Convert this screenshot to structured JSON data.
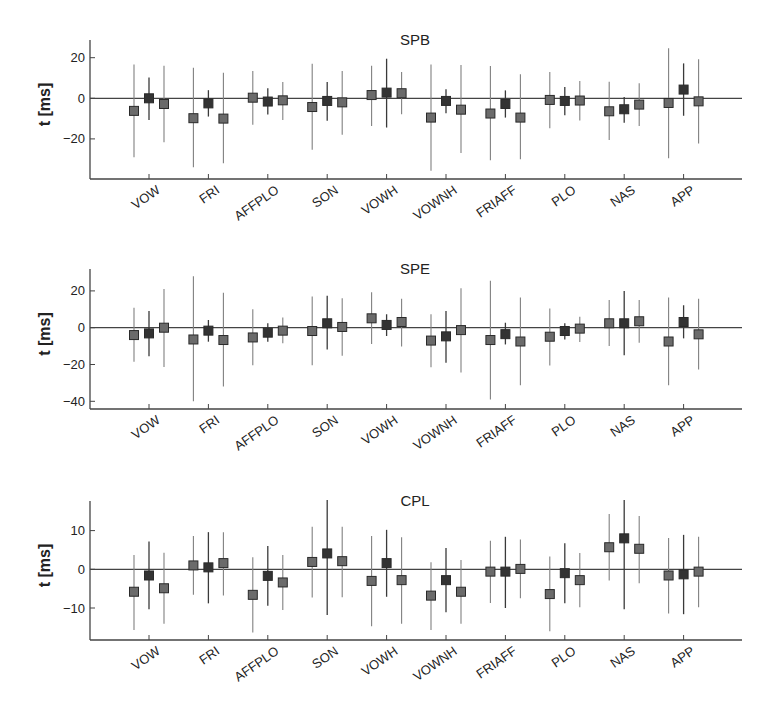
{
  "chart_data": [
    {
      "type": "scatter",
      "subtype": "errorbar",
      "title": "SPB",
      "xlabel": "",
      "ylabel": "t [ms]",
      "categories": [
        "VOW",
        "FRI",
        "AFFPLO",
        "SON",
        "VOWH",
        "VOWNH",
        "FRIAFF",
        "PLO",
        "NAS",
        "APP"
      ],
      "yticks": [
        20,
        0,
        -20
      ],
      "ytick_labels": [
        "20",
        "0",
        "−20"
      ],
      "ylim": [
        -40,
        29
      ],
      "zero_line": true,
      "grid": false,
      "series": [
        {
          "name": "left",
          "color": "#6b6b6b",
          "values": [
            -6.2,
            -9.8,
            0.3,
            -4.3,
            1.6,
            -9.5,
            -7.5,
            -0.8,
            -6.4,
            -2.3
          ],
          "upper": [
            16.7,
            15.0,
            13.4,
            17.0,
            16.0,
            16.7,
            15.9,
            13.0,
            8.2,
            24.6
          ],
          "lower": [
            -29.0,
            -34.0,
            -13.0,
            -25.4,
            -13.6,
            -35.7,
            -30.5,
            -14.8,
            -20.5,
            -29.5
          ]
        },
        {
          "name": "middle",
          "color": "#333333",
          "values": [
            0.0,
            -2.5,
            -1.6,
            -1.3,
            2.8,
            -1.3,
            -2.8,
            -1.3,
            -5.4,
            4.3
          ],
          "upper": [
            10.3,
            4.0,
            5.0,
            8.0,
            19.5,
            4.4,
            3.9,
            5.6,
            0.7,
            17.2
          ],
          "lower": [
            -10.7,
            -9.0,
            -8.0,
            -11.0,
            -14.4,
            -7.4,
            -9.5,
            -8.4,
            -12.0,
            -8.6
          ]
        },
        {
          "name": "right",
          "color": "#6b6b6b",
          "values": [
            -2.8,
            -10.0,
            -1.0,
            -2.0,
            2.5,
            -5.6,
            -9.5,
            -1.1,
            -3.1,
            -1.5
          ],
          "upper": [
            16.0,
            12.6,
            8.0,
            13.4,
            13.0,
            16.4,
            11.8,
            8.5,
            7.4,
            19.2
          ],
          "lower": [
            -21.6,
            -32.0,
            -10.7,
            -18.0,
            -7.9,
            -27.0,
            -30.0,
            -10.9,
            -13.6,
            -22.3
          ]
        }
      ],
      "layout": {
        "top": 40,
        "bottom": 179,
        "zero_y": 98.3,
        "px_per_unit": 2.03
      }
    },
    {
      "type": "scatter",
      "subtype": "errorbar",
      "title": "SPE",
      "xlabel": "",
      "ylabel": "t [ms]",
      "categories": [
        "VOW",
        "FRI",
        "AFFPLO",
        "SON",
        "VOWH",
        "VOWNH",
        "FRIAFF",
        "PLO",
        "NAS",
        "APP"
      ],
      "yticks": [
        20,
        0,
        -20,
        -40
      ],
      "ytick_labels": [
        "20",
        "0",
        "−20",
        "−40"
      ],
      "ylim": [
        -44,
        32
      ],
      "zero_line": true,
      "grid": false,
      "series": [
        {
          "name": "left",
          "color": "#6b6b6b",
          "values": [
            -4.0,
            -6.4,
            -5.3,
            -1.8,
            5.1,
            -7.0,
            -6.7,
            -4.9,
            2.4,
            -7.5
          ],
          "upper": [
            10.9,
            28.0,
            10.0,
            17.0,
            19.3,
            7.3,
            25.5,
            10.4,
            15.0,
            16.4
          ],
          "lower": [
            -18.5,
            -40.0,
            -20.4,
            -20.4,
            -8.9,
            -21.5,
            -39.0,
            -20.5,
            -10.0,
            -31.3
          ]
        },
        {
          "name": "middle",
          "color": "#333333",
          "values": [
            -3.1,
            -1.6,
            -2.7,
            2.4,
            1.5,
            -4.7,
            -3.5,
            -1.8,
            2.4,
            3.1
          ],
          "upper": [
            9.1,
            4.2,
            2.4,
            17.3,
            7.3,
            9.1,
            2.7,
            2.4,
            20.0,
            12.2
          ],
          "lower": [
            -15.5,
            -7.6,
            -7.6,
            -11.8,
            -4.5,
            -19.0,
            -9.1,
            -6.4,
            -15.0,
            -5.8
          ]
        },
        {
          "name": "right",
          "color": "#6b6b6b",
          "values": [
            0.0,
            -6.7,
            -1.6,
            0.4,
            3.1,
            -1.3,
            -7.5,
            -0.5,
            3.5,
            -3.6
          ],
          "upper": [
            21.0,
            19.0,
            5.6,
            16.0,
            15.8,
            21.5,
            16.4,
            6.0,
            15.0,
            15.8
          ],
          "lower": [
            -21.3,
            -32.0,
            -8.5,
            -15.3,
            -10.2,
            -24.4,
            -31.3,
            -7.8,
            -8.2,
            -22.7
          ]
        }
      ],
      "layout": {
        "top": 269,
        "bottom": 409,
        "zero_y": 327.7,
        "px_per_unit": 1.84
      }
    },
    {
      "type": "scatter",
      "subtype": "errorbar",
      "title": "CPL",
      "xlabel": "",
      "ylabel": "t [ms]",
      "categories": [
        "VOW",
        "FRI",
        "AFFPLO",
        "SON",
        "VOWH",
        "VOWNH",
        "FRIAFF",
        "PLO",
        "NAS",
        "APP"
      ],
      "yticks": [
        10,
        0,
        -10
      ],
      "ytick_labels": [
        "10",
        "0",
        "−10"
      ],
      "ylim": [
        -18,
        18
      ],
      "zero_line": true,
      "grid": false,
      "series": [
        {
          "name": "left",
          "color": "#6b6b6b",
          "values": [
            -5.8,
            1.0,
            -6.6,
            1.9,
            -3.0,
            -6.8,
            -0.6,
            -6.4,
            5.7,
            -1.6
          ],
          "upper": [
            3.7,
            8.6,
            3.1,
            11.0,
            8.6,
            1.8,
            7.4,
            3.3,
            14.3,
            8.1
          ],
          "lower": [
            -15.7,
            -6.6,
            -16.3,
            -7.3,
            -14.7,
            -15.7,
            -8.7,
            -16.0,
            -2.9,
            -11.4
          ]
        },
        {
          "name": "middle",
          "color": "#333333",
          "values": [
            -1.6,
            0.5,
            -1.7,
            4.1,
            1.6,
            -2.8,
            -0.6,
            -1.0,
            8.0,
            -1.3
          ],
          "upper": [
            7.2,
            9.6,
            6.0,
            17.9,
            10.2,
            5.5,
            8.4,
            6.7,
            17.9,
            8.9
          ],
          "lower": [
            -10.3,
            -8.8,
            -9.4,
            -11.8,
            -7.1,
            -11.1,
            -10.0,
            -8.8,
            -10.3,
            -11.6
          ]
        },
        {
          "name": "right",
          "color": "#6b6b6b",
          "values": [
            -4.9,
            1.6,
            -3.4,
            2.1,
            -2.8,
            -5.8,
            0.1,
            -2.8,
            5.3,
            -0.6
          ],
          "upper": [
            4.3,
            9.6,
            3.7,
            11.0,
            8.3,
            2.4,
            7.7,
            4.2,
            13.8,
            8.4
          ],
          "lower": [
            -14.1,
            -6.8,
            -10.5,
            -7.2,
            -14.1,
            -14.1,
            -7.5,
            -9.8,
            -3.6,
            -9.8
          ]
        }
      ],
      "layout": {
        "top": 501,
        "bottom": 640,
        "zero_y": 569.3,
        "px_per_unit": 3.87
      }
    }
  ],
  "panels": [
    {
      "title": "SPB",
      "ylabel": "t [ms]"
    },
    {
      "title": "SPE",
      "ylabel": "t [ms]"
    },
    {
      "title": "CPL",
      "ylabel": "t [ms]"
    }
  ]
}
